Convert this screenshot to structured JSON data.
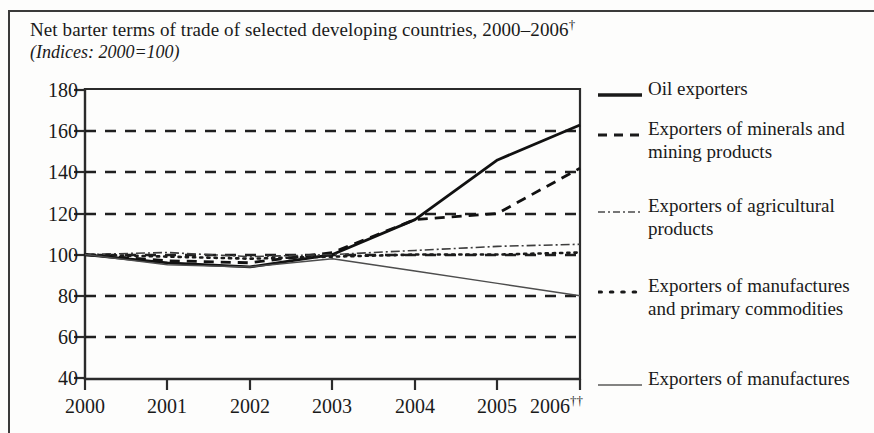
{
  "figure": {
    "title": "Net barter terms of trade of selected developing countries, 2000–2006",
    "title_marker": "†",
    "subtitle": "(Indices: 2000=100)"
  },
  "legend": {
    "items": [
      {
        "label": "Oil exporters",
        "style": "solid"
      },
      {
        "label": "Exporters of minerals and mining products",
        "style": "dashed"
      },
      {
        "label": "Exporters of agricultural products",
        "style": "dashdot"
      },
      {
        "label": "Exporters of manufactures and primary commodities",
        "style": "dotted"
      },
      {
        "label": "Exporters of manufactures",
        "style": "thin-solid"
      }
    ]
  },
  "axes": {
    "y_ticks": [
      "180",
      "160",
      "140",
      "120",
      "100",
      "80",
      "60",
      "40"
    ],
    "x_ticks": [
      "2000",
      "2001",
      "2002",
      "2003",
      "2004",
      "2005",
      "2006"
    ],
    "x_last_marker": "††"
  },
  "chart_data": {
    "type": "line",
    "title": "Net barter terms of trade of selected developing countries, 2000–2006†",
    "subtitle": "(Indices: 2000=100)",
    "xlabel": "",
    "ylabel": "",
    "x": [
      2000,
      2001,
      2002,
      2003,
      2004,
      2005,
      2006
    ],
    "xlim": [
      2000,
      2006
    ],
    "ylim": [
      40,
      180
    ],
    "y_ticks": [
      40,
      60,
      80,
      100,
      120,
      140,
      160,
      180
    ],
    "grid": "horizontal-dashed",
    "legend_position": "right",
    "series": [
      {
        "name": "Oil exporters",
        "style": "solid",
        "values": [
          100,
          96,
          94,
          100,
          117,
          146,
          163
        ]
      },
      {
        "name": "Exporters of minerals and mining products",
        "style": "dashed",
        "values": [
          100,
          97,
          96,
          101,
          117,
          120,
          142
        ]
      },
      {
        "name": "Exporters of agricultural products",
        "style": "dashdot",
        "values": [
          100,
          101,
          99,
          100,
          102,
          104,
          105
        ]
      },
      {
        "name": "Exporters of manufactures and primary commodities",
        "style": "dotted",
        "values": [
          100,
          99,
          98,
          99,
          100,
          100,
          101
        ]
      },
      {
        "name": "Exporters of manufactures",
        "style": "thin-solid",
        "values": [
          100,
          95,
          94,
          98,
          92,
          86,
          80
        ]
      }
    ]
  },
  "colors": {
    "ink": "#1a1a1a",
    "frame": "#3a3a3a",
    "background": "#fdfdfc"
  }
}
